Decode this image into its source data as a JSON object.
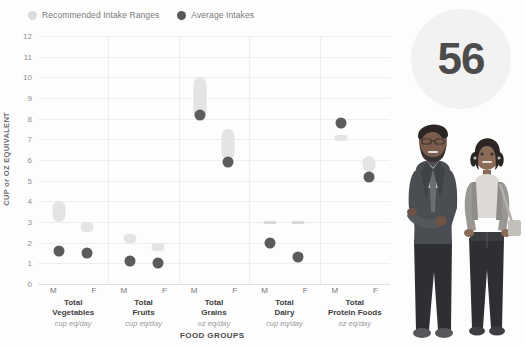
{
  "legend": {
    "items": [
      {
        "label": "Recommended Intake Ranges",
        "icon": "circle-light-icon",
        "color": "#dcdcdc"
      },
      {
        "label": "Average Intakes",
        "icon": "circle-dark-icon",
        "color": "#585858"
      }
    ]
  },
  "badge": {
    "value": "56"
  },
  "axes": {
    "ylabel": "CUP or OZ EQUIVALENT",
    "xlabel": "FOOD GROUPS",
    "yticks": [
      "12",
      "11",
      "10",
      "9",
      "8",
      "7",
      "6",
      "5",
      "4",
      "3",
      "2",
      "1",
      "0"
    ],
    "sex_m": "M",
    "sex_f": "F"
  },
  "chart_data": {
    "type": "scatter",
    "title": "",
    "xlabel": "FOOD GROUPS",
    "ylabel": "CUP or OZ EQUIVALENT",
    "ylim": [
      0,
      12
    ],
    "ytick_step": 1,
    "grid": true,
    "legend": [
      "Recommended Intake Ranges",
      "Average Intakes"
    ],
    "legend_position": "top-left",
    "categories": [
      "Total Vegetables",
      "Total Fruits",
      "Total Grains",
      "Total Dairy",
      "Total Protein Foods"
    ],
    "units": [
      "cup eq/day",
      "cup eq/day",
      "oz eq/day",
      "cup eq/day",
      "oz eq/day"
    ],
    "groups": [
      {
        "name": "Total Vegetables",
        "unit": "cup eq/day",
        "male": {
          "sex": "M",
          "recommended_low": 3.0,
          "recommended_high": 4.0,
          "average": 1.6
        },
        "female": {
          "sex": "F",
          "recommended_low": 2.5,
          "recommended_high": 3.0,
          "average": 1.5
        }
      },
      {
        "name": "Total Fruits",
        "unit": "cup eq/day",
        "male": {
          "sex": "M",
          "recommended_low": 2.0,
          "recommended_high": 2.4,
          "average": 1.1
        },
        "female": {
          "sex": "F",
          "recommended_low": 1.6,
          "recommended_high": 2.0,
          "average": 1.0
        }
      },
      {
        "name": "Total Grains",
        "unit": "oz eq/day",
        "male": {
          "sex": "M",
          "recommended_low": 8.0,
          "recommended_high": 10.0,
          "average": 8.2
        },
        "female": {
          "sex": "F",
          "recommended_low": 6.0,
          "recommended_high": 7.5,
          "average": 5.9
        }
      },
      {
        "name": "Total Dairy",
        "unit": "cup eq/day",
        "male": {
          "sex": "M",
          "recommended_low": 3.0,
          "recommended_high": 3.0,
          "average": 2.0
        },
        "female": {
          "sex": "F",
          "recommended_low": 3.0,
          "recommended_high": 3.0,
          "average": 1.3
        }
      },
      {
        "name": "Total Protein Foods",
        "unit": "oz eq/day",
        "male": {
          "sex": "M",
          "recommended_low": 6.9,
          "recommended_high": 7.2,
          "average": 7.8
        },
        "female": {
          "sex": "F",
          "recommended_low": 5.4,
          "recommended_high": 6.2,
          "average": 5.2
        }
      }
    ]
  },
  "illustration": {
    "figure_male": "person-suit-illustration",
    "figure_female": "person-casual-illustration"
  }
}
